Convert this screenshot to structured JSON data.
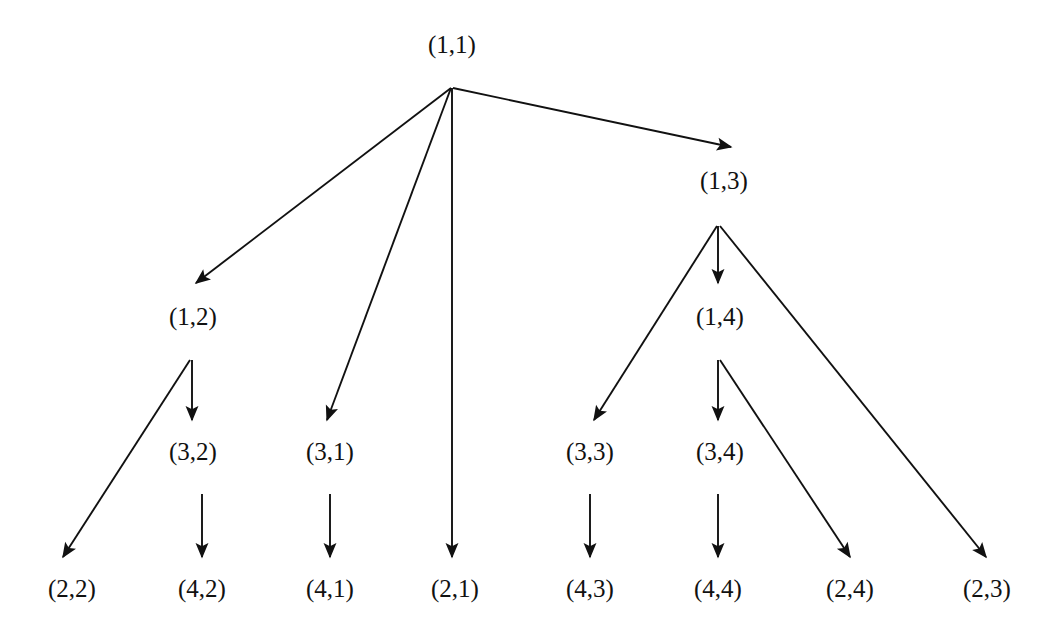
{
  "figure": {
    "kind": "directed-tree-diagram",
    "background_color": "#ffffff",
    "line_color": "#111111",
    "text_color": "#111111",
    "width": 1061,
    "height": 637
  },
  "nodes": [
    {
      "id": "n11",
      "label": "(1,1)",
      "x": 452,
      "y": 45,
      "branch_x": 451,
      "branch_y": 88
    },
    {
      "id": "n13",
      "label": "(1,3)",
      "x": 724,
      "y": 181,
      "branch_x": 718,
      "branch_y": 226
    },
    {
      "id": "n12",
      "label": "(1,2)",
      "x": 193,
      "y": 317,
      "branch_x": 192,
      "branch_y": 360
    },
    {
      "id": "n14",
      "label": "(1,4)",
      "x": 720,
      "y": 317,
      "branch_x": 718,
      "branch_y": 360
    },
    {
      "id": "n32",
      "label": "(3,2)",
      "x": 193,
      "y": 452,
      "branch_x": 192,
      "branch_y": 494
    },
    {
      "id": "n31",
      "label": "(3,1)",
      "x": 330,
      "y": 452,
      "branch_x": 330,
      "branch_y": 494
    },
    {
      "id": "n33",
      "label": "(3,3)",
      "x": 590,
      "y": 452,
      "branch_x": 590,
      "branch_y": 494
    },
    {
      "id": "n34",
      "label": "(3,4)",
      "x": 720,
      "y": 452,
      "branch_x": 718,
      "branch_y": 494
    },
    {
      "id": "n22",
      "label": "(2,2)",
      "x": 72,
      "y": 589,
      "branch_x": 72,
      "branch_y": 589
    },
    {
      "id": "n42",
      "label": "(4,2)",
      "x": 202,
      "y": 589,
      "branch_x": 202,
      "branch_y": 589
    },
    {
      "id": "n41",
      "label": "(4,1)",
      "x": 330,
      "y": 589,
      "branch_x": 330,
      "branch_y": 589
    },
    {
      "id": "n21",
      "label": "(2,1)",
      "x": 455,
      "y": 589,
      "branch_x": 455,
      "branch_y": 589
    },
    {
      "id": "n43",
      "label": "(4,3)",
      "x": 590,
      "y": 589,
      "branch_x": 590,
      "branch_y": 589
    },
    {
      "id": "n44",
      "label": "(4,4)",
      "x": 718,
      "y": 589,
      "branch_x": 718,
      "branch_y": 589
    },
    {
      "id": "n24",
      "label": "(2,4)",
      "x": 850,
      "y": 589,
      "branch_x": 850,
      "branch_y": 589
    },
    {
      "id": "n23",
      "label": "(2,3)",
      "x": 987,
      "y": 589,
      "branch_x": 987,
      "branch_y": 589
    }
  ],
  "edges": [
    {
      "from": "(1,1)",
      "to": "(1,2)",
      "x1": 451,
      "y1": 88,
      "x2": 196,
      "y2": 283
    },
    {
      "from": "(1,1)",
      "to": "(3,1)",
      "x1": 451,
      "y1": 88,
      "x2": 327,
      "y2": 420
    },
    {
      "from": "(1,1)",
      "to": "(2,1)",
      "x1": 452,
      "y1": 88,
      "x2": 452,
      "y2": 557
    },
    {
      "from": "(1,1)",
      "to": "(1,3)",
      "x1": 453,
      "y1": 88,
      "x2": 731,
      "y2": 147
    },
    {
      "from": "(1,3)",
      "to": "(1,4)",
      "x1": 718,
      "y1": 226,
      "x2": 718,
      "y2": 283
    },
    {
      "from": "(1,3)",
      "to": "(3,3)",
      "x1": 717,
      "y1": 226,
      "x2": 594,
      "y2": 420
    },
    {
      "from": "(1,3)",
      "to": "(2,3)",
      "x1": 720,
      "y1": 226,
      "x2": 986,
      "y2": 557
    },
    {
      "from": "(1,4)",
      "to": "(3,4)",
      "x1": 718,
      "y1": 360,
      "x2": 718,
      "y2": 420
    },
    {
      "from": "(1,4)",
      "to": "(2,4)",
      "x1": 720,
      "y1": 360,
      "x2": 850,
      "y2": 557
    },
    {
      "from": "(1,2)",
      "to": "(3,2)",
      "x1": 192,
      "y1": 360,
      "x2": 192,
      "y2": 420
    },
    {
      "from": "(1,2)",
      "to": "(2,2)",
      "x1": 190,
      "y1": 360,
      "x2": 63,
      "y2": 557
    },
    {
      "from": "(3,2)",
      "to": "(4,2)",
      "x1": 202,
      "y1": 494,
      "x2": 202,
      "y2": 557
    },
    {
      "from": "(3,1)",
      "to": "(4,1)",
      "x1": 330,
      "y1": 494,
      "x2": 330,
      "y2": 557
    },
    {
      "from": "(3,3)",
      "to": "(4,3)",
      "x1": 590,
      "y1": 494,
      "x2": 590,
      "y2": 557
    },
    {
      "from": "(3,4)",
      "to": "(4,4)",
      "x1": 718,
      "y1": 494,
      "x2": 718,
      "y2": 557
    }
  ]
}
